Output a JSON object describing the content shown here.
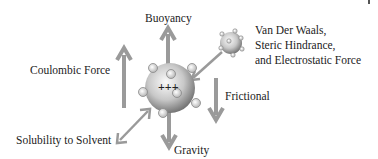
{
  "diagram": {
    "labels": {
      "buoyancy": "Buoyancy",
      "coulombic": "Coulombic Force",
      "vdw_line1": "Van Der Waals,",
      "vdw_line2": "Steric Hindrance,",
      "vdw_line3": "and Electrostatic Force",
      "frictional": "Frictional",
      "solubility": "Solubility to Solvent",
      "gravity": "Gravity",
      "charge": "+++"
    },
    "colors": {
      "arrow": "#9a9a9a",
      "sphere_light": "#f4f4f4",
      "sphere_dark": "#7a7a7a",
      "text": "#222222"
    }
  }
}
